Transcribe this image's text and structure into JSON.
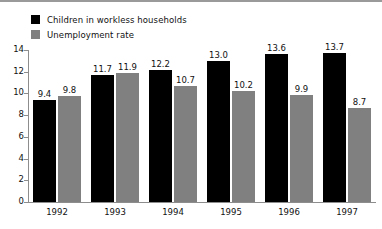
{
  "chart_data": {
    "type": "bar",
    "title": "",
    "subtitle": "",
    "xlabel": "",
    "ylabel": "",
    "categories": [
      "1992",
      "1993",
      "1994",
      "1995",
      "1996",
      "1997"
    ],
    "series": [
      {
        "name": "Children in workless households",
        "color": "#000000",
        "values": [
          9.4,
          11.7,
          12.2,
          13.0,
          13.6,
          13.7
        ],
        "labels": [
          "9.4",
          "11.7",
          "12.2",
          "13.0",
          "13.6",
          "13.7"
        ]
      },
      {
        "name": "Unemployment rate",
        "color": "#808080",
        "values": [
          9.8,
          11.9,
          10.7,
          10.2,
          9.9,
          8.7
        ],
        "labels": [
          "9.8",
          "11.9",
          "10.7",
          "10.2",
          "9.9",
          "8.7"
        ]
      }
    ],
    "ylim": [
      0,
      14
    ],
    "ytick_values": [
      0,
      2,
      4,
      6,
      8,
      10,
      12,
      14
    ],
    "ytick_labels": [
      "0",
      "2",
      "4",
      "6",
      "8",
      "10",
      "12",
      "14"
    ],
    "grid": false,
    "legend_position": "top-left",
    "legend": [
      {
        "label": "Children in workless households",
        "color": "#000000",
        "swatch": "black-square-icon"
      },
      {
        "label": "Unemployment rate",
        "color": "#808080",
        "swatch": "gray-square-icon"
      }
    ]
  }
}
